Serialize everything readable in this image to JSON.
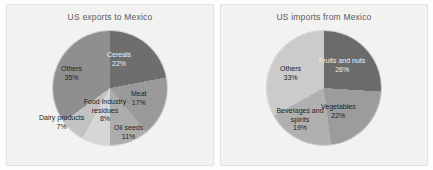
{
  "chart_data": [
    {
      "type": "pie",
      "title": "US exports to Mexico",
      "categories": [
        "Cereals",
        "Meat",
        "Oil seeds",
        "Food industry residues",
        "Dairy products",
        "Others"
      ],
      "values": [
        22,
        17,
        11,
        8,
        7,
        35
      ],
      "value_labels": [
        "22%",
        "17%",
        "11%",
        "8%",
        "7%",
        "35%"
      ],
      "unit": "%",
      "legend": "none",
      "grid": false,
      "slice_colors": [
        "#6e6e6e",
        "#9a9a9a",
        "#acacac",
        "#d6d6d6",
        "#c2c2c2",
        "#8f8f8f"
      ],
      "start_angle_deg": 0,
      "direction": "clockwise"
    },
    {
      "type": "pie",
      "title": "US imports from Mexico",
      "categories": [
        "Fruits and nuts",
        "Vegetables",
        "Beverages and spirits",
        "Others"
      ],
      "values": [
        26,
        22,
        19,
        33
      ],
      "value_labels": [
        "26%",
        "22%",
        "19%",
        "33%"
      ],
      "unit": "%",
      "legend": "none",
      "grid": false,
      "slice_colors": [
        "#6b6b6b",
        "#9c9c9c",
        "#b0b0b0",
        "#cbcbcb"
      ],
      "start_angle_deg": 0,
      "direction": "clockwise"
    }
  ],
  "charts": {
    "left": {
      "title": "US exports to Mexico",
      "labels": {
        "cereals": "Cereals",
        "cereals_pct": "22%",
        "meat": "Meat",
        "meat_pct": "17%",
        "oil_seeds": "Oil seeds",
        "oil_seeds_pct": "11%",
        "food_industry_residues": "Food industry residues",
        "food_industry_residues_pct": "8%",
        "dairy_products": "Dairy products",
        "dairy_products_pct": "7%",
        "others": "Others",
        "others_pct": "35%"
      }
    },
    "right": {
      "title": "US imports from Mexico",
      "labels": {
        "fruits_and_nuts": "Fruits and nuts",
        "fruits_and_nuts_pct": "26%",
        "vegetables": "Vegetables",
        "vegetables_pct": "22%",
        "beverages_and_spirits": "Beverages and spirits",
        "beverages_and_spirits_pct": "19%",
        "others": "Others",
        "others_pct": "33%"
      }
    }
  },
  "colors": {
    "panel_background": "#f2f2f1",
    "page_background": "#fdfdfd",
    "title_text": "#5a5a5a",
    "label_text": "#1d1d1d"
  }
}
